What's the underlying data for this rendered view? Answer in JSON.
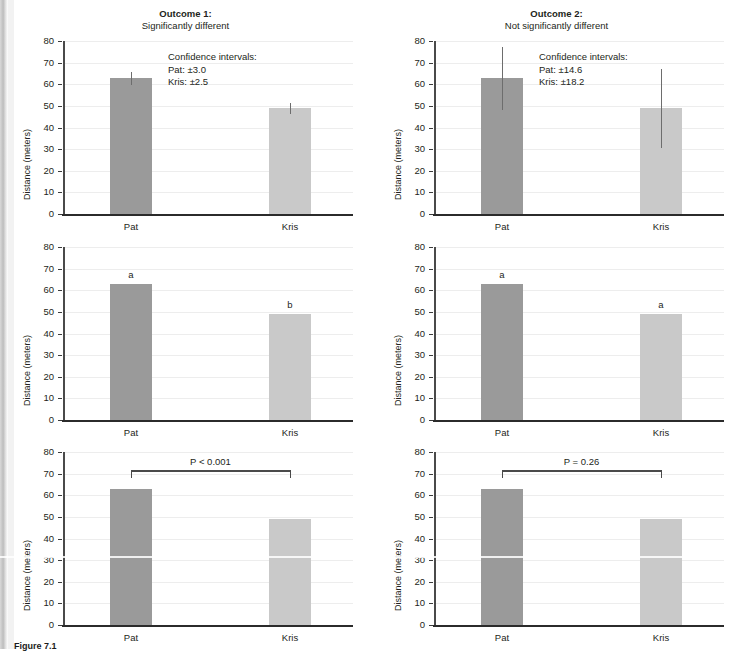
{
  "figure": {
    "caption": "Figure 7.1",
    "axis_label": "Distance (meters)",
    "y_ticks": [
      "80",
      "70",
      "60",
      "50",
      "40",
      "30",
      "20",
      "10",
      "0"
    ],
    "x_categories": [
      "Pat",
      "Kris"
    ]
  },
  "columns": [
    {
      "title_main": "Outcome 1:",
      "title_sub": "Significantly different",
      "ci_note": "Confidence intervals:\nPat: ±3.0\nKris: ±2.5",
      "ci_lines": [
        "Confidence intervals:",
        "Pat: ±3.0",
        "Kris: ±2.5"
      ],
      "sig_letters": [
        "a",
        "b"
      ],
      "p_text": "P < 0.001"
    },
    {
      "title_main": "Outcome 2:",
      "title_sub": "Not significantly different",
      "ci_note": "Confidence intervals:\nPat: ±14.6\nKris: ±18.2",
      "ci_lines": [
        "Confidence intervals:",
        "Pat: ±14.6",
        "Kris: ±18.2"
      ],
      "sig_letters": [
        "a",
        "a"
      ],
      "p_text": "P = 0.26"
    }
  ],
  "chart_data": {
    "type": "bar",
    "xlabel": "",
    "ylabel": "Distance (meters)",
    "ylim": [
      0,
      80
    ],
    "ytick_values": [
      0,
      10,
      20,
      30,
      40,
      50,
      60,
      70,
      80
    ],
    "grid": "horizontal light gridlines",
    "legend": "none",
    "categories": [
      "Pat",
      "Kris"
    ],
    "colors": {
      "pat_bar": "#9a9a9a",
      "kris_bar": "#c9c9c9",
      "axis": "#2b2b2b",
      "gridline": "#ededed"
    },
    "panels": [
      {
        "row": 1,
        "column": 1,
        "panel_title": "Outcome 1: Significantly different",
        "style": "bars with 95% confidence interval error bars",
        "values": [
          62.8,
          48.8
        ],
        "errors": [
          3.0,
          2.5
        ],
        "annotation": "Confidence intervals: Pat: ±3.0  Kris: ±2.5"
      },
      {
        "row": 1,
        "column": 2,
        "panel_title": "Outcome 2: Not significantly different",
        "style": "bars with 95% confidence interval error bars",
        "values": [
          62.8,
          48.8
        ],
        "errors": [
          14.6,
          18.2
        ],
        "annotation": "Confidence intervals: Pat: ±14.6  Kris: ±18.2"
      },
      {
        "row": 2,
        "column": 1,
        "panel_title": "Outcome 1 — significance letters",
        "style": "bars with significance letters",
        "values": [
          62.8,
          48.8
        ],
        "letters": [
          "a",
          "b"
        ]
      },
      {
        "row": 2,
        "column": 2,
        "panel_title": "Outcome 2 — significance letters",
        "style": "bars with significance letters",
        "values": [
          62.8,
          48.8
        ],
        "letters": [
          "a",
          "a"
        ]
      },
      {
        "row": 3,
        "column": 1,
        "panel_title": "Outcome 1 — P value bracket",
        "style": "bars with P-value bracket",
        "values": [
          62.8,
          48.8
        ],
        "p_value_label": "P < 0.001"
      },
      {
        "row": 3,
        "column": 2,
        "panel_title": "Outcome 2 — P value bracket",
        "style": "bars with P-value bracket",
        "values": [
          62.8,
          48.8
        ],
        "p_value_label": "P = 0.26"
      }
    ]
  }
}
